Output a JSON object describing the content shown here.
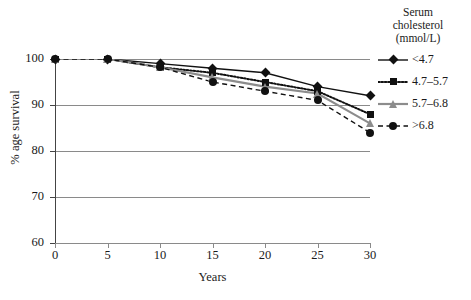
{
  "chart_data": {
    "type": "line",
    "title": "",
    "xlabel": "Years",
    "ylabel": "% age survival",
    "xlim": [
      0,
      30
    ],
    "ylim": [
      60,
      100
    ],
    "x": [
      0,
      5,
      10,
      15,
      20,
      25,
      30
    ],
    "xticks": [
      "0",
      "5",
      "10",
      "15",
      "20",
      "25",
      "30"
    ],
    "yticks": [
      "60",
      "70",
      "80",
      "90",
      "100"
    ],
    "grid": "horizontal",
    "legend_position": "right",
    "legend_title": "Serum cholesterol (mmol/L)",
    "legend_title_lines": [
      "Serum",
      "cholesterol",
      "(mmol/L)"
    ],
    "series": [
      {
        "name": "<4.7",
        "marker": "diamond",
        "linestyle": "solid",
        "color": "#111111",
        "values": [
          100,
          100,
          99,
          98,
          97,
          94,
          92
        ]
      },
      {
        "name": "4.7–5.7",
        "marker": "square",
        "linestyle": "dotted",
        "color": "#111111",
        "values": [
          100,
          100,
          98.2,
          97,
          95,
          93,
          88
        ]
      },
      {
        "name": "5.7–6.8",
        "marker": "triangle",
        "linestyle": "solid",
        "color": "#8c8c8c",
        "values": [
          100,
          100,
          98.2,
          96,
          94,
          92.5,
          86
        ]
      },
      {
        "name": ">6.8",
        "marker": "circle",
        "linestyle": "dashed",
        "color": "#111111",
        "values": [
          100,
          100,
          98.2,
          95,
          93,
          91,
          84
        ]
      }
    ]
  },
  "axis": {
    "x_title": "Years",
    "y_title": "% age survival"
  }
}
